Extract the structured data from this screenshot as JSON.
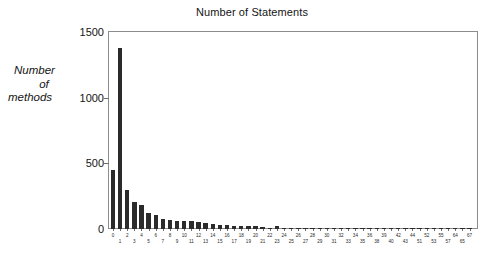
{
  "chart_data": {
    "type": "bar",
    "title": "Number of Statements",
    "xlabel": "",
    "ylabel": "Number of methods",
    "ylabel_lines": [
      "Number",
      "of",
      "methods"
    ],
    "ylim": [
      0,
      1500
    ],
    "yticks": [
      0,
      500,
      1000,
      1500
    ],
    "ytick_labels": [
      "0",
      "500",
      "1000",
      "1500"
    ],
    "grid": false,
    "legend": null,
    "bar_color": "#2b2b2b",
    "frame_color": "#8d8d8d",
    "categories": [
      "0",
      "1",
      "2",
      "3",
      "4",
      "5",
      "6",
      "7",
      "8",
      "9",
      "10",
      "11",
      "12",
      "13",
      "14",
      "15",
      "16",
      "17",
      "18",
      "19",
      "20",
      "21",
      "22",
      "23",
      "24",
      "25",
      "26",
      "27",
      "28",
      "29",
      "30",
      "31",
      "32",
      "33",
      "34",
      "35",
      "36",
      "38",
      "39",
      "40",
      "42",
      "43",
      "44",
      "51",
      "52",
      "53",
      "55",
      "57",
      "64",
      "65",
      "67"
    ],
    "values": [
      450,
      1375,
      300,
      205,
      180,
      125,
      110,
      78,
      70,
      62,
      60,
      58,
      52,
      48,
      36,
      30,
      28,
      26,
      24,
      24,
      22,
      12,
      10,
      20,
      8,
      8,
      8,
      8,
      8,
      8,
      8,
      8,
      8,
      8,
      8,
      6,
      6,
      6,
      6,
      6,
      6,
      6,
      6,
      4,
      4,
      4,
      4,
      4,
      4,
      4,
      4
    ],
    "series": [
      {
        "name": "Number of methods",
        "values": [
          450,
          1375,
          300,
          205,
          180,
          125,
          110,
          78,
          70,
          62,
          60,
          58,
          52,
          48,
          36,
          30,
          28,
          26,
          24,
          24,
          22,
          12,
          10,
          20,
          8,
          8,
          8,
          8,
          8,
          8,
          8,
          8,
          8,
          8,
          8,
          6,
          6,
          6,
          6,
          6,
          6,
          6,
          6,
          4,
          4,
          4,
          4,
          4,
          4,
          4,
          4
        ]
      }
    ],
    "xtick_rows": {
      "top": [
        "0",
        "2",
        "4",
        "6",
        "8",
        "10",
        "12",
        "14",
        "16",
        "18",
        "20",
        "22",
        "24",
        "26",
        "28",
        "30",
        "32",
        "34",
        "36",
        "39",
        "42",
        "44",
        "52",
        "55",
        "64",
        "67"
      ],
      "bottom": [
        "1",
        "3",
        "5",
        "7",
        "9",
        "11",
        "13",
        "15",
        "17",
        "19",
        "21",
        "23",
        "25",
        "27",
        "29",
        "31",
        "33",
        "35",
        "38",
        "40",
        "43",
        "51",
        "53",
        "57",
        "65"
      ]
    }
  }
}
